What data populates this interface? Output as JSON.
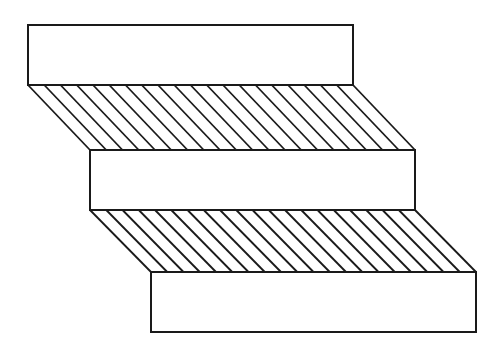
{
  "diagram": {
    "title": "",
    "stroke_color": "#1a1a1a",
    "fill_color": "#ffffff",
    "background": "#ffffff",
    "blocks": [
      {
        "id": "block-top",
        "label": ""
      },
      {
        "id": "block-middle",
        "label": ""
      },
      {
        "id": "block-bottom",
        "label": ""
      }
    ],
    "bands": [
      {
        "id": "band-upper",
        "pattern": "diagonal-hatch",
        "hatch_line_count": 21
      },
      {
        "id": "band-lower",
        "pattern": "diagonal-hatch",
        "hatch_line_count": 21
      }
    ]
  }
}
